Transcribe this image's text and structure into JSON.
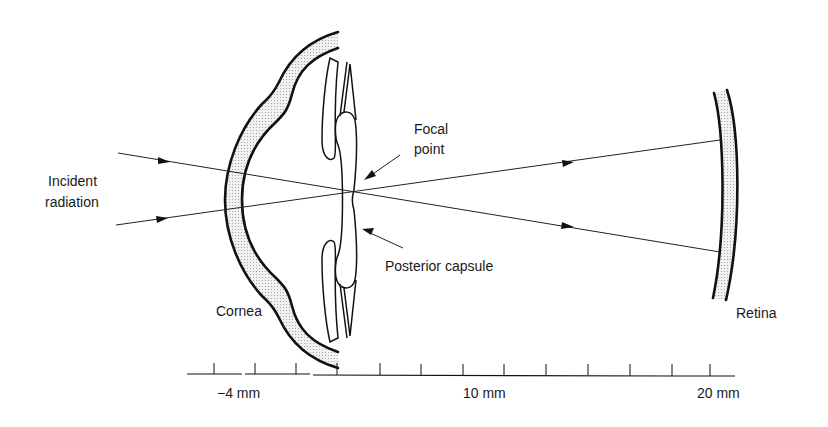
{
  "figure": {
    "labels": {
      "incident_line1": "Incident",
      "incident_line2": "radiation",
      "focal_line1": "Focal",
      "focal_line2": "point",
      "posterior_capsule": "Posterior capsule",
      "cornea": "Cornea",
      "retina": "Retina"
    },
    "scale": {
      "labels": [
        "−4 mm",
        "10 mm",
        "20 mm"
      ],
      "tick_count": 13
    },
    "colors": {
      "line": "#111111",
      "stipple": "#d9d9d9",
      "background": "#ffffff"
    }
  }
}
